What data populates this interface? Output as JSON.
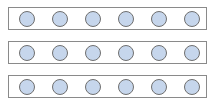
{
  "diagram": {
    "rows": [
      {
        "top": 7,
        "circles": 6
      },
      {
        "top": 41,
        "circles": 6
      },
      {
        "top": 75,
        "circles": 6
      }
    ],
    "circle_fill": "#c6d6ec",
    "circle_stroke": "#6f6f6f",
    "rect_stroke": "#8a8a8a",
    "circle_centers_x": [
      27,
      60,
      93,
      126,
      159,
      192
    ]
  }
}
